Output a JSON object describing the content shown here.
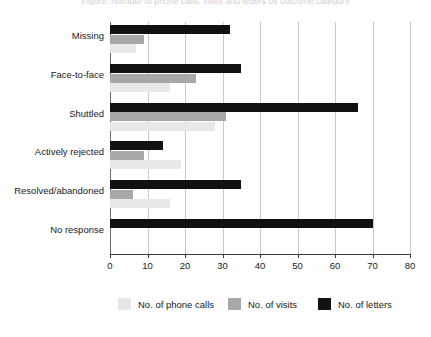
{
  "top_caption": "Figure: Number of phone calls, visits and letters by outcome category",
  "chart_data": {
    "type": "bar",
    "orientation": "horizontal",
    "title": "",
    "subtitle": "",
    "xlabel": "",
    "ylabel": "",
    "xlim": [
      0,
      80
    ],
    "xticks": [
      0,
      10,
      20,
      30,
      40,
      50,
      60,
      70,
      80
    ],
    "xtick_labels": [
      "0",
      "10",
      "20",
      "30",
      "40",
      "50",
      "60",
      "70",
      "80"
    ],
    "grid": true,
    "grid_axis": "x",
    "legend_position": "bottom",
    "categories": [
      "Missing",
      "Face-to-face",
      "Shuttled",
      "Actively rejected",
      "Resolved/abandoned",
      "No response"
    ],
    "series": [
      {
        "name": "No. of letters",
        "color": "#111111",
        "values": [
          32,
          35,
          66,
          14,
          35,
          70
        ]
      },
      {
        "name": "No. of visits",
        "color": "#a8a8a8",
        "values": [
          9,
          23,
          31,
          9,
          6,
          0
        ]
      },
      {
        "name": "No. of phone calls",
        "color": "#e8e8e8",
        "values": [
          7,
          16,
          28,
          19,
          16,
          0
        ]
      }
    ]
  },
  "legend": {
    "items": [
      {
        "label": "No. of phone calls",
        "key": "calls"
      },
      {
        "label": "No. of visits",
        "key": "visits"
      },
      {
        "label": "No. of letters",
        "key": "letters"
      }
    ]
  }
}
